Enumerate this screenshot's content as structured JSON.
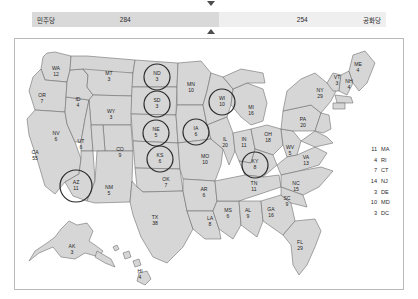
{
  "header": {
    "dem_party_label": "민주당",
    "dem_seats": "284",
    "rep_seats": "254",
    "rep_party_label": "공화당",
    "marker_top_icon": "triangle-down-icon",
    "marker_bottom_icon": "triangle-up-icon",
    "dem_color": "#d9d9d9",
    "rep_color": "#efefef"
  },
  "map": {
    "title": "us-electoral-college-map",
    "states": [
      {
        "abbr": "WA",
        "votes": "12",
        "x": 41,
        "y": 31,
        "circled": false
      },
      {
        "abbr": "OR",
        "votes": "7",
        "x": 27,
        "y": 58,
        "circled": false
      },
      {
        "abbr": "CA",
        "votes": "55",
        "x": 20,
        "y": 115,
        "circled": false
      },
      {
        "abbr": "NV",
        "votes": "6",
        "x": 41,
        "y": 96,
        "circled": false
      },
      {
        "abbr": "ID",
        "votes": "4",
        "x": 63,
        "y": 62,
        "circled": false
      },
      {
        "abbr": "MT",
        "votes": "3",
        "x": 94,
        "y": 36,
        "circled": false
      },
      {
        "abbr": "WY",
        "votes": "3",
        "x": 96,
        "y": 74,
        "circled": false
      },
      {
        "abbr": "UT",
        "votes": "6",
        "x": 66,
        "y": 104,
        "circled": false
      },
      {
        "abbr": "AZ",
        "votes": "11",
        "x": 61,
        "y": 145,
        "circled": true
      },
      {
        "abbr": "CO",
        "votes": "9",
        "x": 105,
        "y": 112,
        "circled": false
      },
      {
        "abbr": "NM",
        "votes": "5",
        "x": 94,
        "y": 150,
        "circled": false
      },
      {
        "abbr": "ND",
        "votes": "3",
        "x": 142,
        "y": 36,
        "circled": true
      },
      {
        "abbr": "SD",
        "votes": "3",
        "x": 142,
        "y": 63,
        "circled": true
      },
      {
        "abbr": "NE",
        "votes": "5",
        "x": 141,
        "y": 92,
        "circled": true
      },
      {
        "abbr": "KS",
        "votes": "6",
        "x": 145,
        "y": 118,
        "circled": true
      },
      {
        "abbr": "OK",
        "votes": "7",
        "x": 151,
        "y": 142,
        "circled": false
      },
      {
        "abbr": "TX",
        "votes": "38",
        "x": 140,
        "y": 180,
        "circled": false
      },
      {
        "abbr": "MN",
        "votes": "10",
        "x": 176,
        "y": 47,
        "circled": false
      },
      {
        "abbr": "IA",
        "votes": "6",
        "x": 181,
        "y": 91,
        "circled": true
      },
      {
        "abbr": "MO",
        "votes": "10",
        "x": 190,
        "y": 119,
        "circled": false
      },
      {
        "abbr": "AR",
        "votes": "6",
        "x": 189,
        "y": 152,
        "circled": false
      },
      {
        "abbr": "LA",
        "votes": "8",
        "x": 195,
        "y": 181,
        "circled": false
      },
      {
        "abbr": "WI",
        "votes": "10",
        "x": 207,
        "y": 61,
        "circled": true
      },
      {
        "abbr": "IL",
        "votes": "20",
        "x": 210,
        "y": 102,
        "circled": false
      },
      {
        "abbr": "MS",
        "votes": "6",
        "x": 213,
        "y": 173,
        "circled": false
      },
      {
        "abbr": "MI",
        "votes": "16",
        "x": 236,
        "y": 70,
        "circled": false
      },
      {
        "abbr": "IN",
        "votes": "11",
        "x": 229,
        "y": 102,
        "circled": false
      },
      {
        "abbr": "KY",
        "votes": "8",
        "x": 240,
        "y": 124,
        "circled": true
      },
      {
        "abbr": "TN",
        "votes": "11",
        "x": 239,
        "y": 146,
        "circled": false
      },
      {
        "abbr": "AL",
        "votes": "9",
        "x": 233,
        "y": 173,
        "circled": false
      },
      {
        "abbr": "GA",
        "votes": "16",
        "x": 256,
        "y": 172,
        "circled": false
      },
      {
        "abbr": "FL",
        "votes": "29",
        "x": 285,
        "y": 205,
        "circled": false
      },
      {
        "abbr": "OH",
        "votes": "18",
        "x": 253,
        "y": 97,
        "circled": false
      },
      {
        "abbr": "WV",
        "votes": "5",
        "x": 275,
        "y": 110,
        "circled": false
      },
      {
        "abbr": "VA",
        "votes": "13",
        "x": 291,
        "y": 120,
        "circled": false
      },
      {
        "abbr": "NC",
        "votes": "15",
        "x": 281,
        "y": 146,
        "circled": false
      },
      {
        "abbr": "SC",
        "votes": "9",
        "x": 272,
        "y": 161,
        "circled": false
      },
      {
        "abbr": "PA",
        "votes": "20",
        "x": 288,
        "y": 82,
        "circled": false
      },
      {
        "abbr": "NY",
        "votes": "29",
        "x": 305,
        "y": 53,
        "circled": false
      },
      {
        "abbr": "VT",
        "votes": "3",
        "x": 322,
        "y": 40,
        "circled": false
      },
      {
        "abbr": "NH",
        "votes": "4",
        "x": 334,
        "y": 44,
        "circled": false
      },
      {
        "abbr": "ME",
        "votes": "4",
        "x": 343,
        "y": 27,
        "circled": false
      },
      {
        "abbr": "AK",
        "votes": "3",
        "x": 57,
        "y": 209,
        "circled": false
      },
      {
        "abbr": "HI",
        "votes": "4",
        "x": 125,
        "y": 234,
        "circled": false
      }
    ],
    "legend": [
      {
        "votes": "11",
        "abbr": "MA"
      },
      {
        "votes": "4",
        "abbr": "RI"
      },
      {
        "votes": "7",
        "abbr": "CT"
      },
      {
        "votes": "14",
        "abbr": "NJ"
      },
      {
        "votes": "3",
        "abbr": "DE"
      },
      {
        "votes": "10",
        "abbr": "MD"
      },
      {
        "votes": "3",
        "abbr": "DC"
      }
    ],
    "land_fill": "#d6d6d6",
    "border_color": "#6e6e6e",
    "circle_color": "#2a2a2a"
  }
}
